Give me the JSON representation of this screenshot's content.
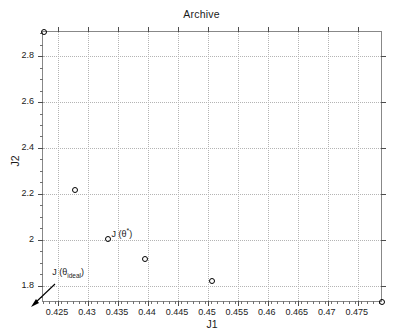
{
  "chart_data": {
    "type": "scatter",
    "title": "Archive",
    "xlabel": "J1",
    "ylabel": "J2",
    "xlim": [
      0.4225,
      0.4792
    ],
    "ylim": [
      1.725,
      2.905
    ],
    "grid": true,
    "legend": null,
    "xticks": [
      0.425,
      0.43,
      0.435,
      0.44,
      0.445,
      0.45,
      0.455,
      0.46,
      0.465,
      0.47,
      0.475
    ],
    "xtick_labels": [
      "0.425",
      "0.43",
      "0.435",
      "0.44",
      "0.445",
      "0.45",
      "0.455",
      "0.46",
      "0.465",
      "0.47",
      "0.475"
    ],
    "yticks": [
      1.8,
      2.0,
      2.2,
      2.4,
      2.6,
      2.8
    ],
    "ytick_labels": [
      "1.8",
      "2",
      "2.2",
      "2.4",
      "2.6",
      "2.8"
    ],
    "x": [
      0.4226,
      0.4279,
      0.4333,
      0.4395,
      0.4506,
      0.479
    ],
    "y": [
      2.905,
      2.215,
      2.005,
      1.915,
      1.822,
      1.728
    ],
    "points": [
      {
        "x": 0.4226,
        "y": 2.905
      },
      {
        "x": 0.4279,
        "y": 2.215
      },
      {
        "x": 0.4333,
        "y": 2.005
      },
      {
        "x": 0.4395,
        "y": 1.915
      },
      {
        "x": 0.4506,
        "y": 1.822
      },
      {
        "x": 0.479,
        "y": 1.728
      }
    ],
    "marker": "open-circle",
    "marker_color": "#000000",
    "annotations": [
      {
        "name": "j-theta-star",
        "text_main": "J (θ",
        "text_sup": "*",
        "text_close": ")",
        "x": 0.4341,
        "y": 2.022
      },
      {
        "name": "j-theta-ideal",
        "text_main": "J (θ",
        "text_sub": "ideal",
        "text_close": ")",
        "x": 0.4242,
        "y": 1.845
      }
    ]
  },
  "chart": {
    "title": "Archive",
    "xlabel": "J1",
    "ylabel": "J2",
    "annot_star": {
      "main": "J (θ",
      "sup": "*",
      "close": ")"
    },
    "annot_ideal": {
      "main": "J (θ",
      "sub": "ideal",
      "close": ")"
    }
  }
}
